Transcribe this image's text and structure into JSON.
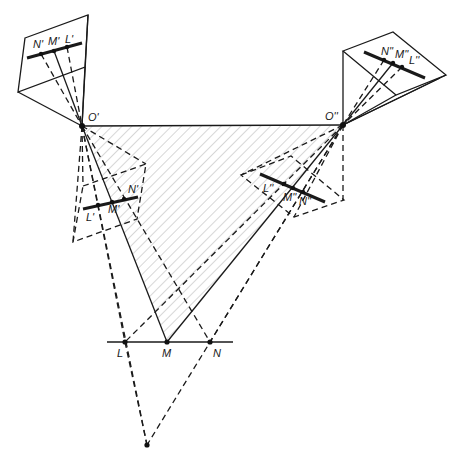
{
  "diagram": {
    "colors": {
      "line": "#1a1a1a",
      "hatch": "#b0b0b0",
      "background": "#ffffff"
    },
    "labels": {
      "O1": "O'",
      "O2": "O''",
      "L": "L",
      "M": "M",
      "N": "N",
      "N1_top": "N'",
      "M1_top": "M'",
      "L1_top": "L'",
      "N2_top": "N''",
      "M2_top": "M''",
      "L2_top": "L''",
      "L1_low": "L'",
      "M1_low": "M'",
      "N1_low": "N'",
      "L2_low": "L''",
      "M2_low": "M''",
      "N2_low": "N''"
    },
    "points": {
      "O1": [
        82,
        126
      ],
      "O2": [
        343,
        125
      ],
      "L": [
        125,
        342
      ],
      "M": [
        167,
        342
      ],
      "N": [
        210,
        342
      ],
      "bottom": [
        147,
        445
      ]
    }
  }
}
